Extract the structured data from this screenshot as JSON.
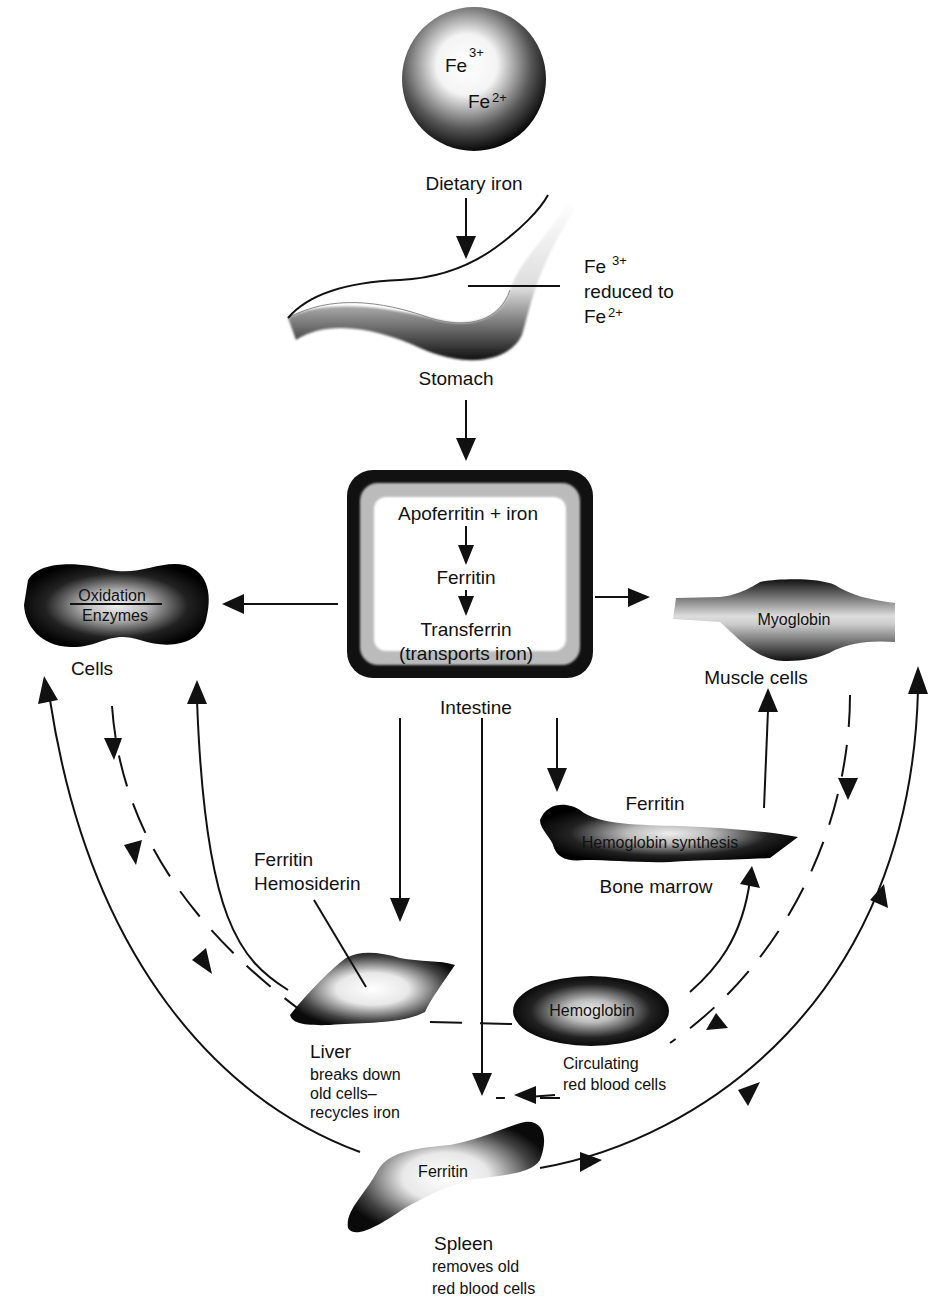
{
  "nodes": {
    "dietary_iron": {
      "label": "Dietary iron",
      "ion1": "Fe",
      "ion1_charge": "3+",
      "ion2": "Fe",
      "ion2_charge": "2+"
    },
    "stomach": {
      "label": "Stomach",
      "note_line1": "Fe",
      "note_charge1": "3+",
      "note_line2": "reduced to",
      "note_line3": "Fe",
      "note_charge3": "2+"
    },
    "intestine": {
      "label": "Intestine",
      "line1": "Apoferritin + iron",
      "line2": "Ferritin",
      "line3": "Transferrin",
      "line4": "(transports iron)"
    },
    "cells": {
      "label": "Cells",
      "top": "Oxidation",
      "bottom": "Enzymes"
    },
    "muscle_cells": {
      "label": "Muscle cells",
      "inside": "Myoglobin"
    },
    "bone_marrow": {
      "label": "Bone marrow",
      "top": "Ferritin",
      "inside": "Hemoglobin synthesis"
    },
    "liver": {
      "label": "Liver",
      "desc1": "breaks down",
      "desc2": "old cells–",
      "desc3": "recycles iron",
      "callout1": "Ferritin",
      "callout2": "Hemosiderin"
    },
    "red_blood_cells": {
      "inside": "Hemoglobin",
      "label1": "Circulating",
      "label2": "red blood cells"
    },
    "spleen": {
      "label": "Spleen",
      "inside": "Ferritin",
      "desc1": "removes old",
      "desc2": "red blood cells"
    }
  },
  "colors": {
    "ink": "#111111",
    "background": "#ffffff"
  }
}
